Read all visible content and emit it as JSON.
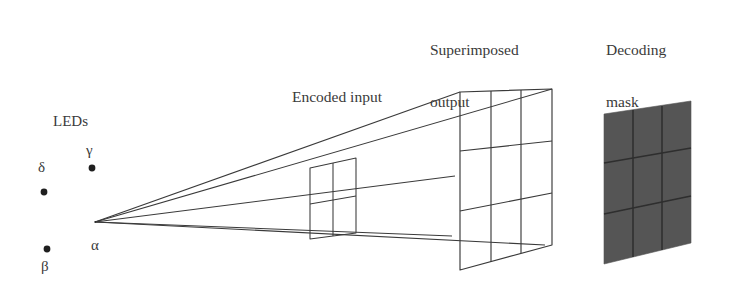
{
  "figure": {
    "background": "#ffffff",
    "line_color": "#3a3a3a",
    "mask_fill": "#555555",
    "labels": {
      "superimposed_output_line1": "Superimposed",
      "superimposed_output_line2": "output",
      "decoding_mask_line1": "Decoding",
      "decoding_mask_line2": "mask",
      "encoded_input": "Encoded input",
      "leds": "LEDs"
    },
    "leds": [
      {
        "name": "alpha",
        "symbol": "α",
        "label_position": "right",
        "dot_x": 95,
        "dot_y": 222
      },
      {
        "name": "beta",
        "symbol": "β",
        "label_position": "below",
        "dot_x": 47,
        "dot_y": 249
      },
      {
        "name": "gamma",
        "symbol": "γ",
        "label_position": "above",
        "dot_x": 92,
        "dot_y": 168
      },
      {
        "name": "delta",
        "symbol": "δ",
        "label_position": "above",
        "dot_x": 44,
        "dot_y": 192
      }
    ],
    "planes": [
      {
        "name": "encoded-input",
        "rows": 2,
        "cols": 2,
        "filled": false
      },
      {
        "name": "superimposed-output",
        "rows": 3,
        "cols": 3,
        "filled": false
      },
      {
        "name": "decoding-mask",
        "rows": 3,
        "cols": 3,
        "filled": true
      }
    ]
  }
}
